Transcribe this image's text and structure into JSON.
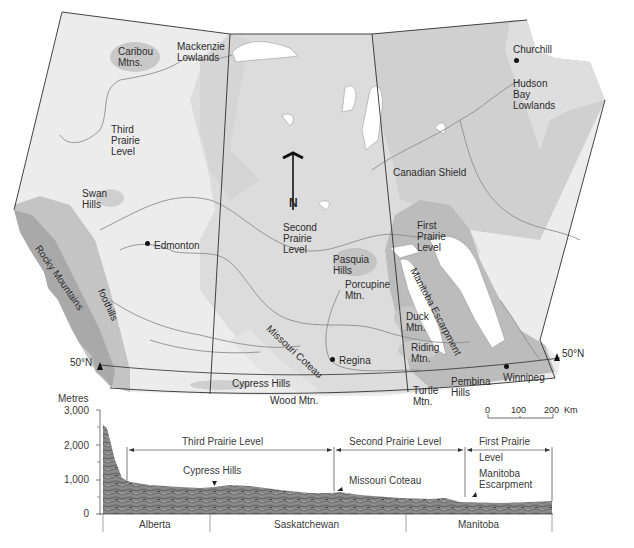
{
  "map": {
    "background_colors": {
      "paper": "#ffffff",
      "third_prairie_level": "#ececec",
      "second_prairie_level": "#dadada",
      "canadian_shield": "#cfcfcf",
      "first_prairie_level": "#b9b9b9",
      "mountains_dark": "#a8a8a8",
      "lakes": "#ffffff",
      "rivers": "#8c8c8c",
      "boundaries": "#333333"
    },
    "regions": [
      {
        "id": "caribou",
        "label": "Caribou Mtns."
      },
      {
        "id": "mackenzie",
        "label": "Mackenzie Lowlands"
      },
      {
        "id": "third",
        "label": "Third Prairie Level"
      },
      {
        "id": "swan",
        "label": "Swan Hills"
      },
      {
        "id": "rocky",
        "label": "Rocky Mountains"
      },
      {
        "id": "foothills",
        "label": "foothills"
      },
      {
        "id": "second",
        "label": "Second Prairie Level"
      },
      {
        "id": "shield",
        "label": "Canadian Shield"
      },
      {
        "id": "hudson",
        "label": "Hudson Bay Lowlands"
      },
      {
        "id": "first",
        "label": "First Prairie Level"
      },
      {
        "id": "pasquia",
        "label": "Pasquia Hills"
      },
      {
        "id": "porcupine",
        "label": "Porcupine Mtn."
      },
      {
        "id": "manitoba_esc",
        "label": "Manitoba Escarpment"
      },
      {
        "id": "duck",
        "label": "Duck Mtn."
      },
      {
        "id": "riding",
        "label": "Riding Mtn."
      },
      {
        "id": "missouri",
        "label": "Missouri Coteau"
      },
      {
        "id": "cypress",
        "label": "Cypress Hills"
      },
      {
        "id": "wood",
        "label": "Wood Mtn."
      },
      {
        "id": "turtle",
        "label": "Turtle Mtn."
      },
      {
        "id": "pembina",
        "label": "Pembina Hills"
      }
    ],
    "cities": [
      {
        "name": "Churchill"
      },
      {
        "name": "Edmonton"
      },
      {
        "name": "Regina"
      },
      {
        "name": "Winnipeg"
      }
    ],
    "latitude_marks": {
      "left": "50°N",
      "right": "50°N"
    },
    "north_arrow": "N",
    "scale_bar": {
      "ticks": [
        "0",
        "100",
        "200"
      ],
      "unit": "Km"
    }
  },
  "profile": {
    "y_axis_title": "Metres",
    "y_ticks": [
      "3,000",
      "2,000",
      "1,000",
      "0"
    ],
    "levels": [
      {
        "label": "Third Prairie Level"
      },
      {
        "label": "Second Prairie Level"
      },
      {
        "label": "First Prairie",
        "label2": "Level"
      }
    ],
    "features": [
      {
        "label": "Cypress Hills"
      },
      {
        "label": "Missouri Coteau"
      },
      {
        "label": "Manitoba",
        "label2": "Escarpment"
      }
    ],
    "provinces": [
      "Alberta",
      "Saskatchewan",
      "Manitoba"
    ]
  }
}
